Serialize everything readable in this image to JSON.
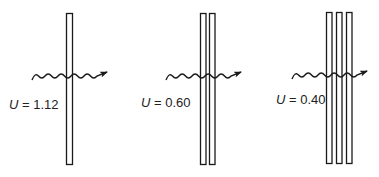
{
  "diagram": {
    "stroke_color": "#1a1a1a",
    "panels": [
      {
        "id": "single-glazing",
        "label_var": "U",
        "label_rest": " = 1.12",
        "value": 1.12,
        "pane_count": 1
      },
      {
        "id": "double-glazing",
        "label_var": "U",
        "label_rest": " = 0.60",
        "value": 0.6,
        "pane_count": 2
      },
      {
        "id": "triple-glazing",
        "label_var": "U",
        "label_rest": " = 0.40",
        "value": 0.4,
        "pane_count": 3
      }
    ]
  }
}
